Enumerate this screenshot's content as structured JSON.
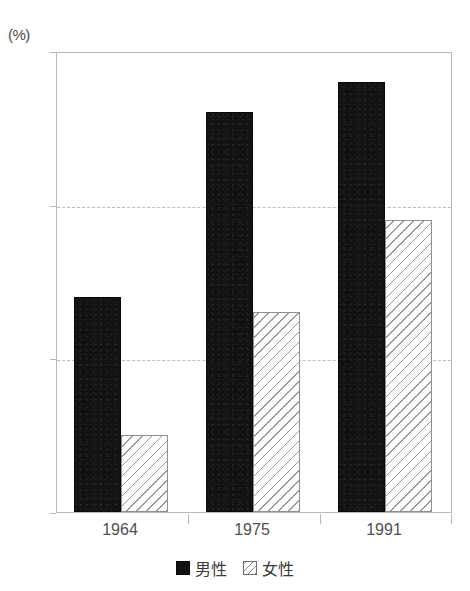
{
  "chart_data": {
    "type": "bar",
    "title": "",
    "subtitle": "",
    "unit_label": "(%)",
    "xlabel": "",
    "ylabel": "",
    "categories": [
      "1964",
      "1975",
      "1991"
    ],
    "series": [
      {
        "name": "男性",
        "values": [
          14,
          26,
          28
        ],
        "style": "solid-black",
        "color": "#121212"
      },
      {
        "name": "女性",
        "values": [
          5,
          13,
          19
        ],
        "style": "diagonal-hatch",
        "color": "#9a9a9a"
      }
    ],
    "ylim": [
      0,
      30
    ],
    "yticks": [
      0,
      10,
      20,
      30
    ],
    "ytick_labels": [
      "0",
      "10",
      "20",
      "30"
    ],
    "gridlines": [
      10,
      20
    ],
    "grid": "horizontal-dashed",
    "legend_position": "bottom-center",
    "legend": [
      "男性",
      "女性"
    ]
  },
  "axes": {
    "unit": "(%)",
    "y_ticks": [
      {
        "label": "30",
        "value": 30
      },
      {
        "label": "20",
        "value": 20
      },
      {
        "label": "10",
        "value": 10
      },
      {
        "label": "0",
        "value": 0
      }
    ],
    "x_ticks": [
      {
        "label": "1964"
      },
      {
        "label": "1975"
      },
      {
        "label": "1991"
      }
    ]
  },
  "legend": {
    "items": [
      {
        "label": "男性",
        "swatch": "solid-black-square"
      },
      {
        "label": "女性",
        "swatch": "hatched-square"
      }
    ]
  }
}
